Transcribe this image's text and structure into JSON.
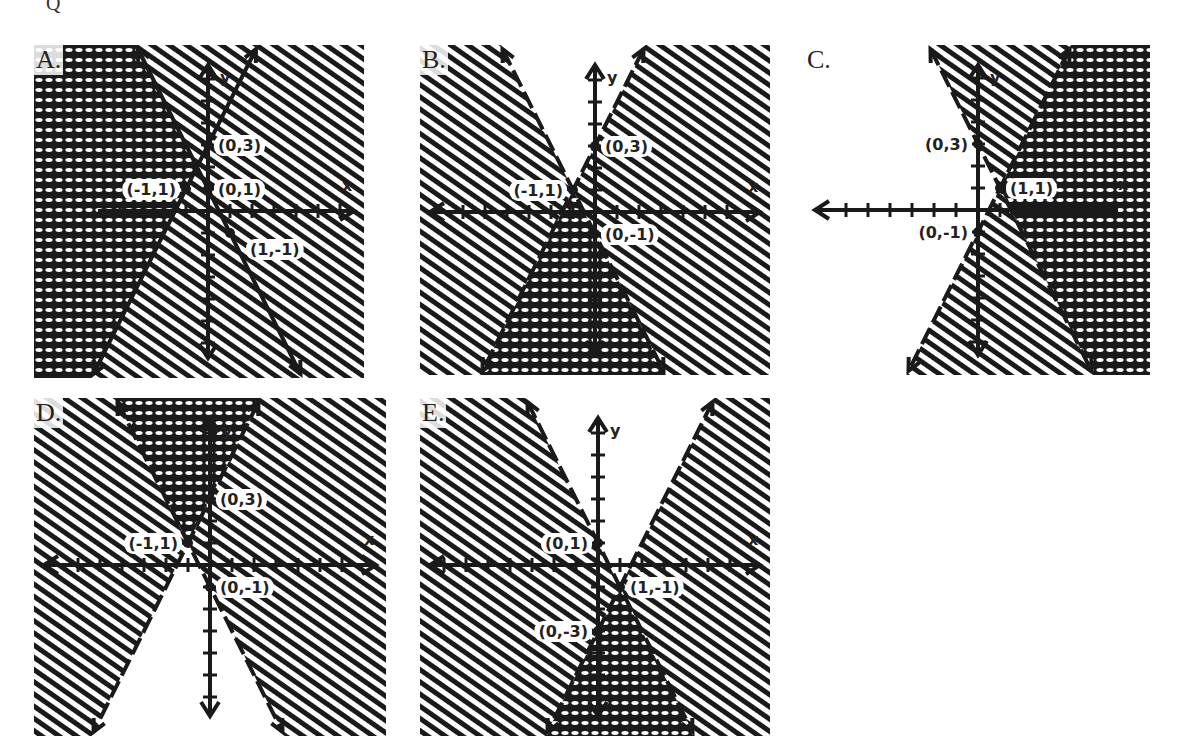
{
  "question_mark": "Q",
  "colors": {
    "ink": "#1a1a1a",
    "paper": "#ffffff"
  },
  "unit_px": 22,
  "panels": [
    {
      "letter": "A.",
      "box": {
        "x": 34,
        "y": 45,
        "w": 330,
        "h": 333
      },
      "origin": {
        "x": 208,
        "y": 211
      },
      "x_axis_dir": "right",
      "line_style": "solid",
      "lines": [
        {
          "slope": -2,
          "intercept": 1,
          "through": [
            "(0,1)",
            "(1,-1)"
          ]
        },
        {
          "slope": 2,
          "intercept": 3,
          "through": [
            "(-1,1)",
            "(0,3)"
          ]
        }
      ],
      "points": [
        {
          "x": 0,
          "y": 3,
          "label": "(0,3)",
          "label_side": "right"
        },
        {
          "x": 0,
          "y": 1,
          "label": "(0,1)",
          "label_side": "right"
        },
        {
          "x": -1,
          "y": 1,
          "label": "(-1,1)",
          "label_side": "left"
        },
        {
          "x": 1,
          "y": -1,
          "label": "(1,-1)",
          "label_side": "below-right"
        }
      ],
      "cross_region": "left of both lines",
      "hatch_region": "between lines",
      "x_label": "x",
      "y_label": "y"
    },
    {
      "letter": "B.",
      "box": {
        "x": 420,
        "y": 45,
        "w": 350,
        "h": 330
      },
      "origin": {
        "x": 595,
        "y": 212
      },
      "x_axis_dir": "both",
      "line_style": "dashed",
      "lines": [
        {
          "slope": 2,
          "intercept": 3,
          "through": [
            "(-1,1)",
            "(0,3)"
          ]
        },
        {
          "slope": -2,
          "intercept": -1,
          "through": [
            "(-1,1)",
            "(0,-1)"
          ]
        }
      ],
      "points": [
        {
          "x": 0,
          "y": 3,
          "label": "(0,3)",
          "label_side": "right"
        },
        {
          "x": -1,
          "y": 1,
          "label": "(-1,1)",
          "label_side": "left"
        },
        {
          "x": 0,
          "y": -1,
          "label": "(0,-1)",
          "label_side": "right"
        }
      ],
      "cross_region": "below both lines",
      "hatch_region": "outside V",
      "x_label": "x",
      "y_label": "y"
    },
    {
      "letter": "C.",
      "box": {
        "x": 805,
        "y": 45,
        "w": 345,
        "h": 330
      },
      "origin": {
        "x": 978,
        "y": 210
      },
      "x_axis_dir": "left",
      "line_style": "dashed",
      "lines": [
        {
          "slope": -2,
          "intercept": 3,
          "through": [
            "(0,3)",
            "(1,1)"
          ]
        },
        {
          "slope": 2,
          "intercept": -1,
          "through": [
            "(0,-1)",
            "(1,1)"
          ]
        }
      ],
      "points": [
        {
          "x": 0,
          "y": 3,
          "label": "(0,3)",
          "label_side": "left"
        },
        {
          "x": 1,
          "y": 1,
          "label": "(1,1)",
          "label_side": "right"
        },
        {
          "x": 0,
          "y": -1,
          "label": "(0,-1)",
          "label_side": "left"
        }
      ],
      "cross_region": "right of both lines",
      "hatch_region": "between lines",
      "x_label": "x",
      "y_label": "y"
    },
    {
      "letter": "D.",
      "box": {
        "x": 34,
        "y": 398,
        "w": 352,
        "h": 338
      },
      "origin": {
        "x": 210,
        "y": 565
      },
      "x_axis_dir": "both",
      "line_style": "dashed",
      "lines": [
        {
          "slope": 2,
          "intercept": 3,
          "through": [
            "(-1,1)",
            "(0,3)"
          ]
        },
        {
          "slope": -2,
          "intercept": -1,
          "through": [
            "(-1,1)",
            "(0,-1)"
          ]
        }
      ],
      "points": [
        {
          "x": 0,
          "y": 3,
          "label": "(0,3)",
          "label_side": "right"
        },
        {
          "x": -1,
          "y": 1,
          "label": "(-1,1)",
          "label_side": "left"
        },
        {
          "x": 0,
          "y": -1,
          "label": "(0,-1)",
          "label_side": "right"
        }
      ],
      "cross_region": "above both lines",
      "hatch_region": "outside V",
      "x_label": "x",
      "y_label": "y"
    },
    {
      "letter": "E.",
      "box": {
        "x": 420,
        "y": 398,
        "w": 350,
        "h": 338
      },
      "origin": {
        "x": 598,
        "y": 565
      },
      "x_axis_dir": "both",
      "line_style": "dashed",
      "lines": [
        {
          "slope": -2,
          "intercept": 1,
          "through": [
            "(0,1)",
            "(1,-1)"
          ]
        },
        {
          "slope": 2,
          "intercept": -3,
          "through": [
            "(0,-3)",
            "(1,-1)"
          ]
        }
      ],
      "points": [
        {
          "x": 0,
          "y": 1,
          "label": "(0,1)",
          "label_side": "left"
        },
        {
          "x": 1,
          "y": -1,
          "label": "(1,-1)",
          "label_side": "right"
        },
        {
          "x": 0,
          "y": -3,
          "label": "(0,-3)",
          "label_side": "left"
        }
      ],
      "cross_region": "below both lines",
      "hatch_region": "outside V",
      "x_label": "x",
      "y_label": "y"
    }
  ]
}
